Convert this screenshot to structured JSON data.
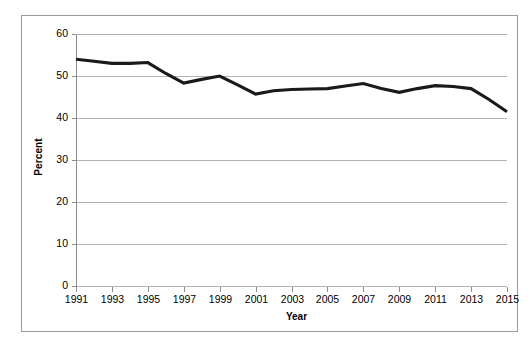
{
  "chart_data": {
    "type": "line",
    "title": "",
    "xlabel": "Year",
    "ylabel": "Percent",
    "ylim": [
      0,
      60
    ],
    "yticks": [
      0,
      10,
      20,
      30,
      40,
      50,
      60
    ],
    "ytick_labels": [
      "0",
      "10",
      "20",
      "30",
      "40",
      "50",
      "60"
    ],
    "xlim": [
      1991,
      2015
    ],
    "xticks": [
      1991,
      1993,
      1995,
      1997,
      1999,
      2001,
      2003,
      2005,
      2007,
      2009,
      2011,
      2013,
      2015
    ],
    "xtick_labels": [
      "1991",
      "1993",
      "1995",
      "1997",
      "1999",
      "2001",
      "2003",
      "2005",
      "2007",
      "2009",
      "2011",
      "2013",
      "2015"
    ],
    "grid": "horizontal",
    "legend": "none",
    "x": [
      1991,
      1992,
      1993,
      1994,
      1995,
      1996,
      1997,
      1998,
      1999,
      2000,
      2001,
      2002,
      2003,
      2004,
      2005,
      2006,
      2007,
      2008,
      2009,
      2010,
      2011,
      2012,
      2013,
      2014,
      2015
    ],
    "values": [
      54.0,
      53.5,
      53.0,
      53.0,
      53.2,
      50.6,
      48.3,
      49.2,
      50.0,
      47.9,
      45.7,
      46.5,
      46.8,
      46.9,
      47.0,
      47.6,
      48.2,
      47.0,
      46.1,
      47.0,
      47.7,
      47.5,
      47.0,
      44.4,
      41.5
    ],
    "series": [
      {
        "name": "Percent",
        "color": "#1a1a1a",
        "values": [
          54.0,
          53.5,
          53.0,
          53.0,
          53.2,
          50.6,
          48.3,
          49.2,
          50.0,
          47.9,
          45.7,
          46.5,
          46.8,
          46.9,
          47.0,
          47.6,
          48.2,
          47.0,
          46.1,
          47.0,
          47.7,
          47.5,
          47.0,
          44.4,
          41.5
        ]
      }
    ],
    "annotations": []
  },
  "colors": {
    "line": "#1a1a1a",
    "grid": "#b3b3b3",
    "axis": "#8c8c8c",
    "frame": "#9b9b9b",
    "background": "#ffffff",
    "text": "#000000"
  },
  "axes": {
    "y_title": "Percent",
    "x_title": "Year"
  }
}
